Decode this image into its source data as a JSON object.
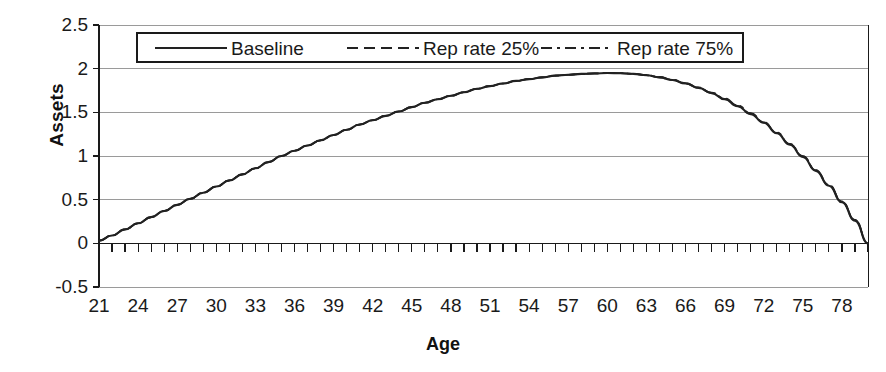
{
  "chart_data": {
    "type": "line",
    "title": "",
    "xlabel": "Age",
    "ylabel": "Assets",
    "xlim": [
      21,
      80
    ],
    "ylim": [
      -0.5,
      2.5
    ],
    "grid": true,
    "legend_position": "top-center-inside",
    "x_tick_labels": [
      "21",
      "24",
      "27",
      "30",
      "33",
      "36",
      "39",
      "42",
      "45",
      "48",
      "51",
      "54",
      "57",
      "60",
      "63",
      "66",
      "69",
      "72",
      "75",
      "78"
    ],
    "x_tick_values": [
      21,
      24,
      27,
      30,
      33,
      36,
      39,
      42,
      45,
      48,
      51,
      54,
      57,
      60,
      63,
      66,
      69,
      72,
      75,
      78
    ],
    "x_minor_tick_step": 1,
    "y_tick_labels": [
      "2.5",
      "2",
      "1.5",
      "1",
      "0.5",
      "0",
      "-0.5"
    ],
    "y_tick_values": [
      2.5,
      2,
      1.5,
      1,
      0.5,
      0,
      -0.5
    ],
    "x": [
      21,
      22,
      23,
      24,
      25,
      26,
      27,
      28,
      29,
      30,
      31,
      32,
      33,
      34,
      35,
      36,
      37,
      38,
      39,
      40,
      41,
      42,
      43,
      44,
      45,
      46,
      47,
      48,
      49,
      50,
      51,
      52,
      53,
      54,
      55,
      56,
      57,
      58,
      59,
      60,
      61,
      62,
      63,
      64,
      65,
      66,
      67,
      68,
      69,
      70,
      71,
      72,
      73,
      74,
      75,
      76,
      77,
      78,
      79,
      80
    ],
    "series": [
      {
        "name": "Baseline",
        "style": "solid",
        "color": "#222222",
        "values": [
          0.03,
          0.09,
          0.16,
          0.23,
          0.3,
          0.37,
          0.44,
          0.51,
          0.58,
          0.65,
          0.72,
          0.79,
          0.86,
          0.93,
          1.0,
          1.06,
          1.12,
          1.18,
          1.24,
          1.3,
          1.36,
          1.41,
          1.46,
          1.51,
          1.56,
          1.61,
          1.65,
          1.69,
          1.73,
          1.77,
          1.8,
          1.83,
          1.86,
          1.88,
          1.9,
          1.92,
          1.93,
          1.94,
          1.945,
          1.95,
          1.948,
          1.94,
          1.925,
          1.9,
          1.87,
          1.83,
          1.78,
          1.72,
          1.65,
          1.57,
          1.48,
          1.38,
          1.26,
          1.13,
          0.99,
          0.83,
          0.66,
          0.47,
          0.26,
          0.0
        ]
      },
      {
        "name": "Rep rate 25%",
        "style": "dashed",
        "color": "#222222",
        "values": [
          0.03,
          0.09,
          0.16,
          0.23,
          0.3,
          0.37,
          0.44,
          0.51,
          0.58,
          0.65,
          0.72,
          0.79,
          0.86,
          0.93,
          1.0,
          1.06,
          1.12,
          1.18,
          1.24,
          1.3,
          1.36,
          1.41,
          1.46,
          1.51,
          1.56,
          1.61,
          1.65,
          1.69,
          1.73,
          1.77,
          1.8,
          1.83,
          1.86,
          1.88,
          1.9,
          1.92,
          1.93,
          1.94,
          1.945,
          1.95,
          1.948,
          1.94,
          1.925,
          1.9,
          1.87,
          1.83,
          1.78,
          1.72,
          1.655,
          1.575,
          1.485,
          1.385,
          1.265,
          1.135,
          0.995,
          0.835,
          0.665,
          0.475,
          0.265,
          0.0
        ]
      },
      {
        "name": "Rep rate 75%",
        "style": "dashdot",
        "color": "#222222",
        "values": [
          0.03,
          0.09,
          0.16,
          0.23,
          0.3,
          0.37,
          0.44,
          0.51,
          0.58,
          0.65,
          0.72,
          0.79,
          0.86,
          0.93,
          1.0,
          1.06,
          1.12,
          1.18,
          1.24,
          1.3,
          1.36,
          1.41,
          1.46,
          1.51,
          1.56,
          1.61,
          1.65,
          1.69,
          1.73,
          1.77,
          1.8,
          1.83,
          1.86,
          1.88,
          1.9,
          1.92,
          1.93,
          1.94,
          1.945,
          1.95,
          1.949,
          1.942,
          1.928,
          1.905,
          1.875,
          1.835,
          1.785,
          1.725,
          1.66,
          1.58,
          1.49,
          1.39,
          1.27,
          1.14,
          1.0,
          0.84,
          0.67,
          0.48,
          0.27,
          0.0
        ]
      }
    ]
  },
  "legend": {
    "items": [
      {
        "label": "Baseline",
        "style": "solid"
      },
      {
        "label": "Rep rate 25%",
        "style": "dashed"
      },
      {
        "label": "Rep rate 75%",
        "style": "dashdot"
      }
    ]
  },
  "colors": {
    "line": "#222222",
    "grid": "#9a9a9a",
    "axis": "#1a1a1a",
    "background": "#ffffff"
  }
}
